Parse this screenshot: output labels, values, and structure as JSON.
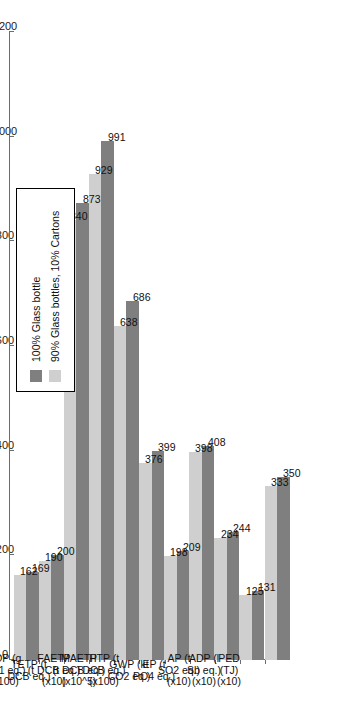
{
  "chart_data": {
    "type": "bar",
    "orientation": "vertical-rotated",
    "title": "",
    "xlabel": "",
    "ylabel": "",
    "ylim": [
      0,
      1200
    ],
    "yticks": [
      0,
      200,
      400,
      600,
      800,
      1000,
      1200
    ],
    "grid": false,
    "legend_position": "upper-left-inset",
    "categories": [
      "PED (TJ) (x10)",
      "ADP (l Sb eq.) (x10)",
      "AP (t SO2 eq.) (x10)",
      "EP (t PO4 eq.)",
      "GWP (kt CO2 eq.)",
      "HTP (t DCB eq.) (x100)",
      "MAETP (t DCB eq.) (x10^5)",
      "FAETP (t DCB eq.) (x10)",
      "TETP (t DCB eq.)",
      "ODP (g R-11 eq.) (x100)",
      "POCP (t C2H4 eq.)"
    ],
    "category_lines": [
      [
        "PED",
        "(TJ)",
        "(x10)"
      ],
      [
        "ADP (l",
        "Sb eq.)",
        "(x10)"
      ],
      [
        "AP (t",
        "SO2 eq.)",
        "(x10)"
      ],
      [
        "EP (t",
        "PO4 eq.)",
        ""
      ],
      [
        "GWP (kt",
        "CO2 eq.)",
        ""
      ],
      [
        "HTP (t",
        "DCB eq.)",
        "(x100)"
      ],
      [
        "MAETP",
        "(t DCB eq.)",
        "(x10^5)"
      ],
      [
        "FAETP",
        "(t DCB eq.)",
        "(x10)"
      ],
      [
        "TETP (t",
        "DCB eq.)",
        ""
      ],
      [
        "ODP (g",
        "R-11 eq.)",
        "(x100)"
      ],
      [
        "POCP",
        "(t C2H4",
        "eq.)"
      ]
    ],
    "series": [
      {
        "name": "100% Glass bottle",
        "color": "#7f7f7f",
        "values": [
          350,
          131,
          244,
          408,
          209,
          399,
          686,
          991,
          873,
          200,
          169
        ]
      },
      {
        "name": "90% Glass bottles, 10% Cartons",
        "color": "#cfcfcf",
        "values": [
          333,
          125,
          234,
          398,
          198,
          376,
          638,
          929,
          840,
          190,
          162
        ]
      }
    ]
  },
  "legend": {
    "items": [
      {
        "label": "100% Glass bottle",
        "swatch": "dark"
      },
      {
        "label": "90% Glass bottles, 10% Cartons",
        "swatch": "light"
      }
    ]
  },
  "colors": {
    "series_dark": "#7f7f7f",
    "series_light": "#cfcfcf",
    "axis": "#6d6d6d",
    "text": "#111111",
    "background": "#ffffff"
  }
}
